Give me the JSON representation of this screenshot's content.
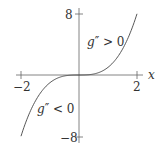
{
  "chart_data": {
    "type": "line",
    "title": "",
    "xlabel": "x",
    "ylabel": "",
    "xlim": [
      -2,
      2
    ],
    "ylim": [
      -8,
      8
    ],
    "grid": false,
    "legend": null,
    "x_ticks": [
      "-2",
      "2"
    ],
    "y_ticks": [
      "8",
      "-8"
    ],
    "series": [
      {
        "name": "g(x) = x^3",
        "x": [
          -2,
          -1.5,
          -1,
          -0.5,
          0,
          0.5,
          1,
          1.5,
          2
        ],
        "y": [
          -8,
          -3.375,
          -1,
          -0.125,
          0,
          0.125,
          1,
          3.375,
          8
        ]
      }
    ],
    "annotations": [
      {
        "text": "g'' > 0",
        "region": "x > 0 (concave up)"
      },
      {
        "text": "g'' < 0",
        "region": "x < 0 (concave down)"
      }
    ]
  },
  "labels": {
    "x_axis": "x",
    "tick_x_neg": "−2",
    "tick_x_pos": "2",
    "tick_y_pos": "8",
    "tick_y_neg": "−8",
    "annot_upper_g": "g",
    "annot_upper_rest": "″ > 0",
    "annot_lower_g": "g",
    "annot_lower_rest": "″ < 0"
  },
  "colors": {
    "axis": "#555555",
    "curve": "#444444",
    "text": "#333333"
  }
}
